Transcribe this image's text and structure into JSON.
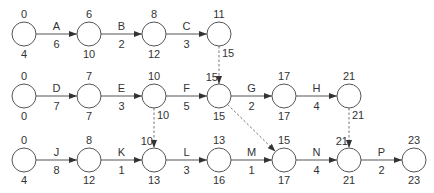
{
  "diagram": {
    "type": "activity-on-arrow network",
    "node_radius": 12,
    "nodes": [
      {
        "id": "r1n1",
        "x": 24,
        "y": 34,
        "top": "0",
        "bottom": "4"
      },
      {
        "id": "r1n2",
        "x": 89,
        "y": 34,
        "top": "6",
        "bottom": "10"
      },
      {
        "id": "r1n3",
        "x": 154,
        "y": 34,
        "top": "8",
        "bottom": "12"
      },
      {
        "id": "r1n4",
        "x": 219,
        "y": 34,
        "top": "11",
        "bottom": ""
      },
      {
        "id": "r2n1",
        "x": 24,
        "y": 96,
        "top": "0",
        "bottom": "0"
      },
      {
        "id": "r2n2",
        "x": 89,
        "y": 96,
        "top": "7",
        "bottom": "7"
      },
      {
        "id": "r2n3",
        "x": 154,
        "y": 96,
        "top": "10",
        "bottom": ""
      },
      {
        "id": "r2n4",
        "x": 219,
        "y": 96,
        "top": "",
        "bottom": "15"
      },
      {
        "id": "r2n5",
        "x": 284,
        "y": 96,
        "top": "17",
        "bottom": "17"
      },
      {
        "id": "r2n6",
        "x": 349,
        "y": 96,
        "top": "21",
        "bottom": ""
      },
      {
        "id": "r3n1",
        "x": 24,
        "y": 160,
        "top": "0",
        "bottom": "4"
      },
      {
        "id": "r3n2",
        "x": 89,
        "y": 160,
        "top": "8",
        "bottom": "12"
      },
      {
        "id": "r3n3",
        "x": 154,
        "y": 160,
        "top": "",
        "bottom": "13"
      },
      {
        "id": "r3n4",
        "x": 219,
        "y": 160,
        "top": "13",
        "bottom": "16"
      },
      {
        "id": "r3n5",
        "x": 284,
        "y": 160,
        "top": "15",
        "bottom": "17"
      },
      {
        "id": "r3n6",
        "x": 349,
        "y": 160,
        "top": "",
        "bottom": "21"
      },
      {
        "id": "r3n7",
        "x": 414,
        "y": 160,
        "top": "23",
        "bottom": "23"
      }
    ],
    "activities": [
      {
        "name": "A",
        "duration": "6",
        "from": "r1n1",
        "to": "r1n2"
      },
      {
        "name": "B",
        "duration": "2",
        "from": "r1n2",
        "to": "r1n3"
      },
      {
        "name": "C",
        "duration": "3",
        "from": "r1n3",
        "to": "r1n4"
      },
      {
        "name": "D",
        "duration": "7",
        "from": "r2n1",
        "to": "r2n2"
      },
      {
        "name": "E",
        "duration": "3",
        "from": "r2n2",
        "to": "r2n3"
      },
      {
        "name": "F",
        "duration": "5",
        "from": "r2n3",
        "to": "r2n4"
      },
      {
        "name": "G",
        "duration": "2",
        "from": "r2n4",
        "to": "r2n5"
      },
      {
        "name": "H",
        "duration": "4",
        "from": "r2n5",
        "to": "r2n6"
      },
      {
        "name": "J",
        "duration": "8",
        "from": "r3n1",
        "to": "r3n2"
      },
      {
        "name": "K",
        "duration": "1",
        "from": "r3n2",
        "to": "r3n3"
      },
      {
        "name": "L",
        "duration": "3",
        "from": "r3n3",
        "to": "r3n4"
      },
      {
        "name": "M",
        "duration": "1",
        "from": "r3n4",
        "to": "r3n5"
      },
      {
        "name": "N",
        "duration": "4",
        "from": "r3n5",
        "to": "r3n6"
      },
      {
        "name": "P",
        "duration": "2",
        "from": "r3n6",
        "to": "r3n7"
      }
    ],
    "dummies": [
      {
        "from": "r1n4",
        "to": "r2n4",
        "start_label": "15",
        "end_label": "15"
      },
      {
        "from": "r2n3",
        "to": "r3n3",
        "start_label": "10",
        "end_label": "10"
      },
      {
        "from": "r2n4",
        "to": "r3n5",
        "start_label": "",
        "end_label": ""
      },
      {
        "from": "r2n6",
        "to": "r3n6",
        "start_label": "21",
        "end_label": "21"
      }
    ]
  }
}
